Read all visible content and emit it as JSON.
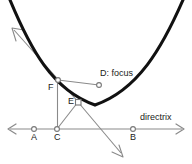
{
  "figure": {
    "width": 192,
    "height": 164,
    "background": "#ffffff"
  },
  "colors": {
    "curve": "#111111",
    "line": "#8a8a8a",
    "text": "#1a1a1a",
    "point_fill": "#ffffff",
    "point_stroke": "#777777"
  },
  "labels": {
    "point_a": "A",
    "point_b": "B",
    "point_c": "C",
    "point_e": "E",
    "point_f": "F",
    "focus": "D: focus",
    "directrix": "directrix"
  },
  "geometry": {
    "points": {
      "A": {
        "x": 34,
        "y": 129
      },
      "B": {
        "x": 133,
        "y": 129
      },
      "C": {
        "x": 57,
        "y": 129
      },
      "D": {
        "x": 99,
        "y": 85
      },
      "E": {
        "x": 78,
        "y": 102
      },
      "F": {
        "x": 58,
        "y": 80
      }
    },
    "directrix_line": {
      "x1": 8,
      "y1": 129,
      "x2": 184,
      "y2": 129,
      "arrows": "both"
    },
    "parabola": {
      "vertex": {
        "x": 95,
        "y": 106
      },
      "left_end": {
        "x": 10,
        "y": 0
      },
      "right_end": {
        "x": 184,
        "y": 0
      }
    },
    "ray_up_left": {
      "x1": 78,
      "y1": 102,
      "x2": 12,
      "y2": 31,
      "arrow": "end"
    },
    "ray_down_right": {
      "x1": 78,
      "y1": 102,
      "x2": 122,
      "y2": 155,
      "arrow": "end"
    },
    "segment_F_D": {
      "x1": 58,
      "y1": 80,
      "x2": 99,
      "y2": 85
    },
    "segment_F_C": {
      "x1": 58,
      "y1": 80,
      "x2": 57,
      "y2": 129
    },
    "segment_C_E": {
      "x1": 57,
      "y1": 129,
      "x2": 78,
      "y2": 102
    },
    "segment_E_D": {
      "x1": 78,
      "y1": 102,
      "x2": 99,
      "y2": 85
    },
    "right_angle_marker": {
      "x": 78,
      "y": 102,
      "size": 5
    }
  }
}
